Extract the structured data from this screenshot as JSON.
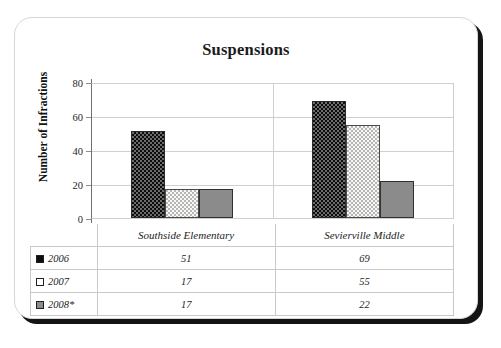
{
  "card": {
    "title": "Suspensions"
  },
  "chart_data": {
    "type": "bar",
    "title": "Suspensions",
    "xlabel": "",
    "ylabel": "Number of Infractions",
    "ylim": [
      0,
      80
    ],
    "yticks": [
      80,
      60,
      40,
      20,
      0
    ],
    "grid": true,
    "legend_position": "table-below",
    "categories": [
      "Southside Elementary",
      "Sevierville Middle"
    ],
    "series": [
      {
        "name": "2006",
        "values": [
          51,
          69
        ],
        "color": "#0d0d0d",
        "swatch": "s2006"
      },
      {
        "name": "2007",
        "values": [
          17,
          55
        ],
        "color": "#f7f7f5",
        "swatch": "s2007"
      },
      {
        "name": "2008*",
        "values": [
          17,
          22
        ],
        "color": "#8b8b8b",
        "swatch": "s2008"
      }
    ]
  },
  "table": {
    "corner_label": "",
    "column_headers": [
      "Southside Elementary",
      "Sevierville Middle"
    ],
    "rows": [
      {
        "label": "2006",
        "swatch": "s2006",
        "values": [
          "51",
          "69"
        ]
      },
      {
        "label": "2007",
        "swatch": "s2007",
        "values": [
          "17",
          "55"
        ]
      },
      {
        "label": "2008*",
        "swatch": "s2008",
        "values": [
          "17",
          "22"
        ]
      }
    ]
  }
}
